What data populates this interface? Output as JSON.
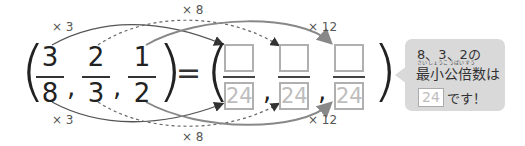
{
  "equation": {
    "left_fractions": [
      {
        "numerator": "3",
        "denominator": "8"
      },
      {
        "numerator": "2",
        "denominator": "3"
      },
      {
        "numerator": "1",
        "denominator": "2"
      }
    ],
    "separator": ",",
    "equals": "=",
    "open_paren": "(",
    "close_paren": ")",
    "right_fractions": [
      {
        "numerator": "",
        "denominator": "24"
      },
      {
        "numerator": "",
        "denominator": "24"
      },
      {
        "numerator": "",
        "denominator": "24"
      }
    ]
  },
  "multipliers": {
    "top_first": "× 3",
    "top_second": "× 8",
    "top_third": "× 12",
    "bottom_first": "× 3",
    "bottom_second": "× 8",
    "bottom_third": "× 12"
  },
  "bubble": {
    "line1": "8、3、2の",
    "ruby": "さいしょうこうばいすう",
    "line2": "最小公倍数は",
    "answer": "24",
    "line3": "です！"
  },
  "colors": {
    "arc_solid_dark": "#555555",
    "arc_dashed": "#777777",
    "arc_solid_gray": "#888888",
    "box_border": "#b0b0b0",
    "denominator_text": "#bdbdbd",
    "bubble_bg": "#d9d9d9"
  }
}
